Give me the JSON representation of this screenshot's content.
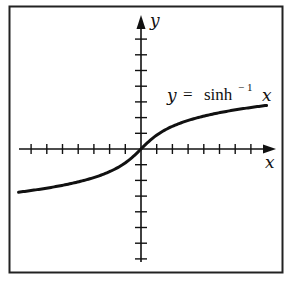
{
  "chart_data": {
    "type": "line",
    "title": "",
    "function": "y = sinh^-1 x",
    "series": [
      {
        "name": "y = sinh⁻¹ x",
        "x": [
          -7.8,
          -6,
          -4,
          -3,
          -2,
          -1,
          -0.5,
          0,
          0.5,
          1,
          2,
          3,
          4,
          6,
          8
        ],
        "values": [
          -2.75,
          -2.49,
          -2.09,
          -1.82,
          -1.44,
          -0.88,
          -0.48,
          0,
          0.48,
          0.88,
          1.44,
          1.82,
          2.09,
          2.49,
          2.78
        ]
      }
    ],
    "xlabel": "x",
    "ylabel": "y",
    "xlim": [
      -7.8,
      8.3
    ],
    "ylim": [
      -7.3,
      8.5
    ],
    "x_ticks": [
      -7,
      -6,
      -5,
      -4,
      -3,
      -2,
      -1,
      1,
      2,
      3,
      4,
      5,
      6,
      7
    ],
    "y_ticks": [
      -7,
      -6,
      -5,
      -4,
      -3,
      -2,
      -1,
      1,
      2,
      3,
      4,
      5,
      6,
      7
    ],
    "tick_labels_shown": false,
    "grid": false,
    "legend": "none",
    "annotations": [
      {
        "text": "y = sinh⁻¹ x",
        "position": "upper right, above curve"
      }
    ]
  },
  "labels": {
    "x_axis": "x",
    "y_axis": "y",
    "eq_y": "y",
    "eq_equals": "=",
    "eq_func": "sinh",
    "eq_exp": "− 1",
    "eq_x": "x"
  },
  "colors": {
    "ink": "#111111",
    "frame": "#222222",
    "background": "#ffffff"
  }
}
